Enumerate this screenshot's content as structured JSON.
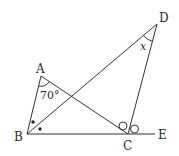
{
  "diagram": {
    "points": {
      "A": {
        "label": "A",
        "x": 41,
        "y": 76
      },
      "B": {
        "label": "B",
        "x": 27,
        "y": 134
      },
      "C": {
        "label": "C",
        "x": 128,
        "y": 134
      },
      "D": {
        "label": "D",
        "x": 157,
        "y": 24
      },
      "E": {
        "label": "E",
        "x": 155,
        "y": 134
      }
    },
    "angle_labels": {
      "A": "70°",
      "D": "x"
    },
    "segments": [
      "AB",
      "AC",
      "BD",
      "CD",
      "BE"
    ],
    "markers": {
      "bisector_B": "dots",
      "bisector_C": "circles"
    }
  }
}
